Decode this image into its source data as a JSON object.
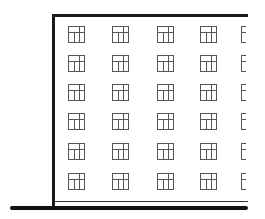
{
  "diagram": {
    "type": "building-elevation",
    "floors": 6,
    "columns_visible": 5,
    "window_style": "three-pane-with-transom",
    "colors": {
      "line": "#1a1a1a",
      "window": "#555555",
      "background": "#ffffff"
    },
    "rows_top_px": [
      26,
      55,
      84,
      113,
      143,
      173
    ],
    "cols_left_px": [
      68,
      112,
      157,
      200,
      241
    ]
  }
}
